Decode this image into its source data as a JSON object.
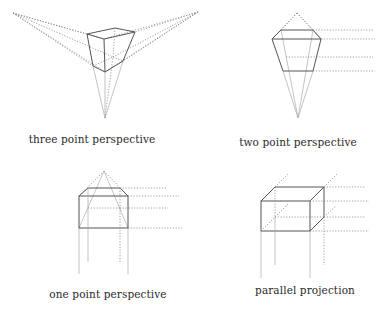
{
  "figure": {
    "panels": [
      {
        "id": "three-point",
        "label": "three point perspective",
        "label_x": 92,
        "label_y": 133
      },
      {
        "id": "two-point",
        "label": "two point perspective",
        "label_x": 298,
        "label_y": 136
      },
      {
        "id": "one-point",
        "label": "one point perspective",
        "label_x": 98,
        "label_y": 288
      },
      {
        "id": "parallel",
        "label": "parallel projection",
        "label_x": 298,
        "label_y": 284
      }
    ],
    "colors": {
      "solid_line": "#555555",
      "dotted_line": "#888888",
      "construction_line": "#aaaaaa",
      "text": "#2a2a2a",
      "background": "#ffffff"
    }
  }
}
